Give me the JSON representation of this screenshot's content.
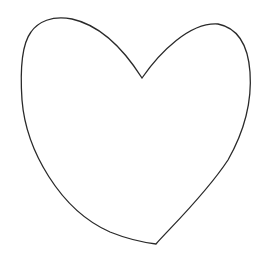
{
  "figure": {
    "shape": "heart-outline",
    "stroke_color": "#2a2a2a",
    "fill_color": "#ffffff",
    "background_color": "#ffffff",
    "stroke_width": "1.3"
  }
}
